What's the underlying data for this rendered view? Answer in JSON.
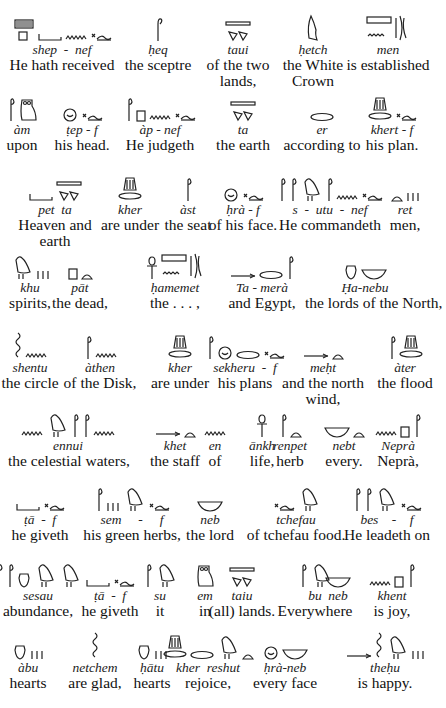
{
  "lines": [
    {
      "groups": [
        {
          "translit": "shep  -  nef",
          "trans": "He hath received"
        },
        {
          "translit": "ḥeq",
          "trans": "the sceptre"
        },
        {
          "translit": "taui",
          "trans": "of the two\nlands,"
        },
        {
          "translit": "ḥetch",
          "trans": "the White\nCrown"
        },
        {
          "translit": "men",
          "trans": "is established"
        }
      ]
    },
    {
      "groups": [
        {
          "translit": "àm",
          "trans": "upon"
        },
        {
          "translit": "ṭep - f",
          "trans": "his head."
        },
        {
          "translit": "àp - nef",
          "trans": "He judgeth"
        },
        {
          "translit": "ta",
          "trans": "the earth"
        },
        {
          "translit": "er",
          "trans": "according to"
        },
        {
          "translit": "khert - f",
          "trans": "his plan."
        }
      ]
    },
    {
      "groups": [
        {
          "translit": "pet  ta",
          "trans": "Heaven and\nearth"
        },
        {
          "translit": "kher",
          "trans": "are under"
        },
        {
          "translit": "àst",
          "trans": "the seat"
        },
        {
          "translit": "ḥrà - f",
          "trans": "of his face."
        },
        {
          "translit": "s  -  utu  -  nef",
          "trans": "He commandeth"
        },
        {
          "translit": "ret",
          "trans": "men,"
        }
      ]
    },
    {
      "groups": [
        {
          "translit": "khu",
          "trans": "spirits,"
        },
        {
          "translit": "pāt",
          "trans": "the dead,"
        },
        {
          "translit": "ḥamemet",
          "trans": "the . . . ,"
        },
        {
          "translit": "Ta - merà",
          "trans": "and Egypt,"
        },
        {
          "translit": "Ḥa-nebu",
          "trans": "the lords of the North,"
        }
      ]
    },
    {
      "groups": [
        {
          "translit": "shentu",
          "trans": "the circle"
        },
        {
          "translit": "àthen",
          "trans": "of the Disk,"
        },
        {
          "translit": "kher",
          "trans": "are under"
        },
        {
          "translit": "sekheru  -  f",
          "trans": "his plans"
        },
        {
          "translit": "meḥt",
          "trans": "and the north\nwind,"
        },
        {
          "translit": "àter",
          "trans": "the flood"
        }
      ]
    },
    {
      "groups": [
        {
          "translit": "ennui",
          "trans": "the celestial waters,"
        },
        {
          "translit": "khet",
          "trans": "the staff"
        },
        {
          "translit": "en",
          "trans": "of"
        },
        {
          "translit": "ānkh",
          "trans": "life,"
        },
        {
          "translit": "renpet",
          "trans": "herb"
        },
        {
          "translit": "nebt",
          "trans": "every."
        },
        {
          "translit": "Neprà",
          "trans": "Neprà,"
        }
      ]
    },
    {
      "groups": [
        {
          "translit": "ṭā  -  f",
          "trans": "he giveth"
        },
        {
          "translit": "sem     -     f",
          "trans": "his green herbs,"
        },
        {
          "translit": "neb",
          "trans": "the lord"
        },
        {
          "translit": "tchefau",
          "trans": "of tchefau food."
        },
        {
          "translit": "bes    -    f",
          "trans": "He leadeth on"
        }
      ]
    },
    {
      "groups": [
        {
          "translit": "sesau",
          "trans": "abundance,"
        },
        {
          "translit": "ṭā  -  f",
          "trans": "he giveth"
        },
        {
          "translit": "su",
          "trans": "it"
        },
        {
          "translit": "em",
          "trans": "in"
        },
        {
          "translit": "taiu",
          "trans": "(all) lands."
        },
        {
          "translit": "bu",
          "trans": "Everywhere"
        },
        {
          "translit": "neb",
          "trans": ""
        },
        {
          "translit": "khent",
          "trans": "is joy,"
        }
      ]
    },
    {
      "groups": [
        {
          "translit": "àbu",
          "trans": "hearts"
        },
        {
          "translit": "netchem",
          "trans": "are glad,"
        },
        {
          "translit": "ḥātu",
          "trans": "hearts"
        },
        {
          "translit": "kher  reshut",
          "trans": "rejoice,"
        },
        {
          "translit": "ḥrà-neb",
          "trans": "every face"
        },
        {
          "translit": "theḥu",
          "trans": "is happy."
        }
      ]
    }
  ]
}
